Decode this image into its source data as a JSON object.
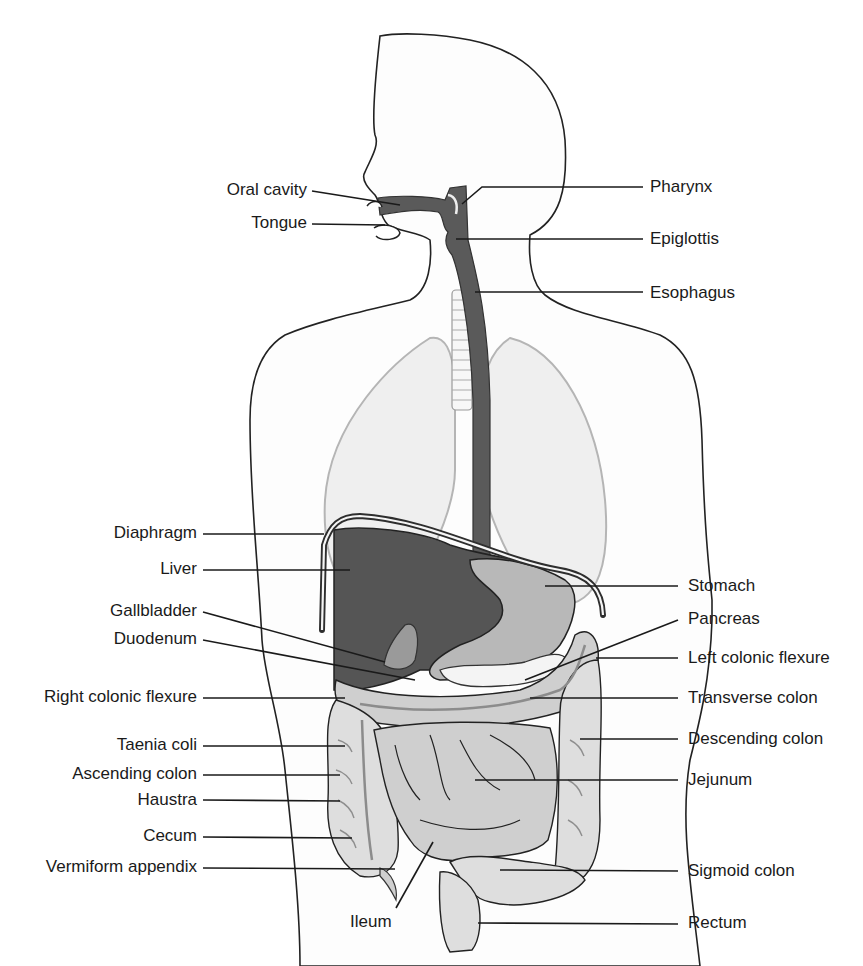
{
  "diagram": {
    "colors": {
      "outline": "#222222",
      "dark_organs": "#555555",
      "stomach": "#b8b8b8",
      "intestines": "#cfcfcf",
      "lungs": "#efefef",
      "background": "#ffffff"
    },
    "labels_left": [
      {
        "id": "oral-cavity",
        "text": "Oral cavity"
      },
      {
        "id": "tongue",
        "text": "Tongue"
      },
      {
        "id": "diaphragm",
        "text": "Diaphragm"
      },
      {
        "id": "liver",
        "text": "Liver"
      },
      {
        "id": "gallbladder",
        "text": "Gallbladder"
      },
      {
        "id": "duodenum",
        "text": "Duodenum"
      },
      {
        "id": "right-colonic-flexure",
        "text": "Right colonic flexure"
      },
      {
        "id": "taenia-coli",
        "text": "Taenia coli"
      },
      {
        "id": "ascending-colon",
        "text": "Ascending colon"
      },
      {
        "id": "haustra",
        "text": "Haustra"
      },
      {
        "id": "cecum",
        "text": "Cecum"
      },
      {
        "id": "vermiform-appendix",
        "text": "Vermiform appendix"
      }
    ],
    "labels_right": [
      {
        "id": "pharynx",
        "text": "Pharynx"
      },
      {
        "id": "epiglottis",
        "text": "Epiglottis"
      },
      {
        "id": "esophagus",
        "text": "Esophagus"
      },
      {
        "id": "stomach",
        "text": "Stomach"
      },
      {
        "id": "pancreas",
        "text": "Pancreas"
      },
      {
        "id": "left-colonic-flexure",
        "text": "Left colonic flexure"
      },
      {
        "id": "transverse-colon",
        "text": "Transverse colon"
      },
      {
        "id": "descending-colon",
        "text": "Descending colon"
      },
      {
        "id": "jejunum",
        "text": "Jejunum"
      },
      {
        "id": "sigmoid-colon",
        "text": "Sigmoid colon"
      },
      {
        "id": "rectum",
        "text": "Rectum"
      }
    ],
    "labels_bottom": [
      {
        "id": "ileum",
        "text": "Ileum"
      }
    ]
  }
}
